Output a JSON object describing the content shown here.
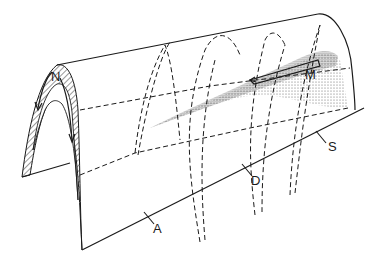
{
  "figure": {
    "line_color": "#1a1a1a",
    "background": "#ffffff"
  },
  "labels": {
    "n": "N",
    "m": "M",
    "a": "A",
    "d": "D",
    "s": "S"
  }
}
